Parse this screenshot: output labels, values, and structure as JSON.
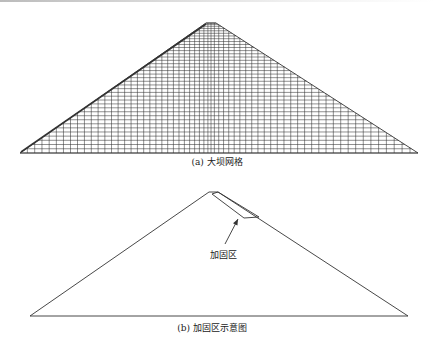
{
  "figure_a": {
    "caption": "(a) 大坝网格",
    "description": "dam finite element mesh",
    "geometry": {
      "base_left_x": 20,
      "base_right_x": 418,
      "base_y": 153,
      "crest_left_x": 206,
      "crest_right_x": 216,
      "crest_y": 23
    },
    "mesh": {
      "columns": 62,
      "rows": 38
    },
    "line_color": "#333333"
  },
  "figure_b": {
    "caption": "(b) 加固区示意图",
    "annotation_label": "加固区",
    "geometry": {
      "base_left_x": 30,
      "base_right_x": 408,
      "base_y": 316,
      "crest_left_x": 209,
      "crest_right_x": 218,
      "crest_y": 192
    },
    "reinforcement_zone": [
      [
        212,
        194
      ],
      [
        218,
        192
      ],
      [
        259,
        217
      ],
      [
        244,
        218
      ]
    ],
    "arrow": {
      "from": [
        225,
        244
      ],
      "to": [
        238,
        219
      ]
    },
    "line_color": "#333333"
  }
}
